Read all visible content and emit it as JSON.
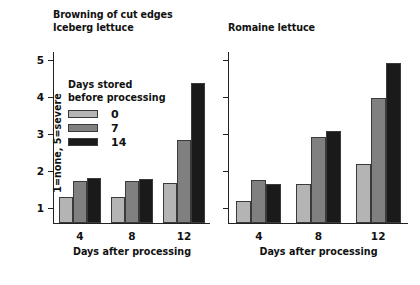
{
  "chart_data": {
    "type": "bar",
    "title": "Browning of cut edges",
    "categories": [
      "4",
      "8",
      "12"
    ],
    "xlabel": "Days after processing",
    "ylabel": "1=none, 5=severe",
    "ylim": [
      0.6,
      5.25
    ],
    "yticks": [
      "1",
      "2",
      "3",
      "4",
      "5"
    ],
    "grid": false,
    "legend": {
      "title_line1": "Days stored",
      "title_line2": "before processing",
      "position": "inside-upper-left",
      "entries": [
        {
          "label": "0",
          "color": "#b4b4b4"
        },
        {
          "label": "7",
          "color": "#808080"
        },
        {
          "label": "14",
          "color": "#1a1a1a"
        }
      ]
    },
    "panels": [
      {
        "name": "Iceberg lettuce",
        "series": [
          {
            "name": "0",
            "values": [
              1.3,
              1.3,
              1.7
            ]
          },
          {
            "name": "7",
            "values": [
              1.75,
              1.75,
              2.85
            ]
          },
          {
            "name": "14",
            "values": [
              1.82,
              1.8,
              4.4
            ]
          }
        ]
      },
      {
        "name": "Romaine lettuce",
        "series": [
          {
            "name": "0",
            "values": [
              1.2,
              1.65,
              2.2
            ]
          },
          {
            "name": "7",
            "values": [
              1.77,
              2.95,
              4.0
            ]
          },
          {
            "name": "14",
            "values": [
              1.65,
              3.1,
              4.95
            ]
          }
        ]
      }
    ]
  },
  "left_panel": {
    "title_line1": "Browning of cut edges",
    "title_line2": "Iceberg lettuce"
  },
  "right_panel": {
    "title": "Romaine lettuce"
  }
}
